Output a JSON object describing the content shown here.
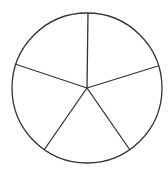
{
  "diagram": {
    "type": "pie-outline",
    "slices": 5,
    "stroke_color": "#333333",
    "fill_color": "#ffffff",
    "center": [
      87,
      88
    ],
    "radius": 75,
    "spoke_endpoints": [
      [
        88,
        13
      ],
      [
        158,
        66
      ],
      [
        130,
        150
      ],
      [
        44,
        150
      ],
      [
        15,
        64
      ]
    ]
  }
}
